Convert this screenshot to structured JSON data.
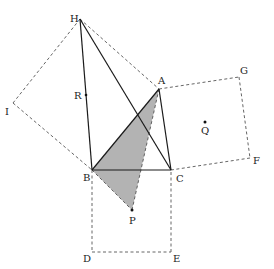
{
  "diagram": {
    "type": "geometry",
    "colors": {
      "shade": "#b3b3b3",
      "solid": "#1a1a1a",
      "dashed": "#555555"
    },
    "points": {
      "A": {
        "x": 159,
        "y": 89,
        "label": "A"
      },
      "B": {
        "x": 92,
        "y": 170,
        "label": "B"
      },
      "C": {
        "x": 171,
        "y": 170,
        "label": "C"
      },
      "D": {
        "x": 92,
        "y": 252,
        "label": "D"
      },
      "E": {
        "x": 171,
        "y": 252,
        "label": "E"
      },
      "F": {
        "x": 250,
        "y": 158,
        "label": "F"
      },
      "G": {
        "x": 239,
        "y": 77,
        "label": "G"
      },
      "H": {
        "x": 80,
        "y": 19,
        "label": "H"
      },
      "I": {
        "x": 13,
        "y": 103,
        "label": "I"
      },
      "P": {
        "x": 132,
        "y": 210,
        "label": "P"
      },
      "Q": {
        "x": 205,
        "y": 122,
        "label": "Q"
      },
      "R": {
        "x": 86,
        "y": 95,
        "label": "R"
      }
    },
    "solid_segments": [
      [
        "H",
        "B"
      ],
      [
        "H",
        "C"
      ],
      [
        "A",
        "B"
      ],
      [
        "A",
        "C"
      ],
      [
        "B",
        "C"
      ]
    ],
    "dashed_segments": [
      [
        "H",
        "A"
      ],
      [
        "H",
        "I"
      ],
      [
        "I",
        "B"
      ],
      [
        "A",
        "G"
      ],
      [
        "G",
        "F"
      ],
      [
        "F",
        "C"
      ],
      [
        "B",
        "D"
      ],
      [
        "D",
        "E"
      ],
      [
        "E",
        "C"
      ],
      [
        "B",
        "P"
      ],
      [
        "A",
        "P"
      ]
    ],
    "shaded_polygon": [
      "B",
      "A",
      "P"
    ],
    "labels": {
      "A": "A",
      "B": "B",
      "C": "C",
      "D": "D",
      "E": "E",
      "F": "F",
      "G": "G",
      "H": "H",
      "I": "I",
      "P": "P",
      "Q": "Q",
      "R": "R"
    }
  }
}
